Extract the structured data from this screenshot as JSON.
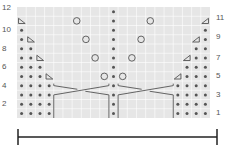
{
  "chart": {
    "type": "knitting-chart",
    "rows": 12,
    "columns": 21,
    "colors": {
      "background": "#e6e6e6",
      "grid": "#ffffff",
      "symbol": "#555555"
    },
    "row_labels_left": [
      "12",
      "10",
      "8",
      "6",
      "4",
      "2"
    ],
    "row_labels_right": [
      "11",
      "9",
      "7",
      "5",
      "3",
      "1"
    ],
    "legend_symbols": {
      "dot": "purl",
      "circle": "yarn-over",
      "triangle-left": "decrease-left",
      "triangle-right": "decrease-right",
      "cable": "cable-cross"
    },
    "dots": {
      "left": [
        [
          1,
          [
            0,
            1,
            2,
            3
          ]
        ],
        [
          2,
          [
            0,
            1,
            2,
            3
          ]
        ],
        [
          3,
          [
            0,
            1,
            2,
            3
          ]
        ],
        [
          4,
          [
            0,
            1,
            2,
            3
          ]
        ],
        [
          5,
          [
            0,
            1,
            2
          ]
        ],
        [
          6,
          [
            0,
            1,
            2
          ]
        ],
        [
          7,
          [
            0,
            1
          ]
        ],
        [
          8,
          [
            0,
            1
          ]
        ],
        [
          9,
          [
            0
          ]
        ],
        [
          10,
          [
            0
          ]
        ]
      ],
      "right": [
        [
          1,
          [
            17,
            18,
            19,
            20
          ]
        ],
        [
          2,
          [
            17,
            18,
            19,
            20
          ]
        ],
        [
          3,
          [
            17,
            18,
            19,
            20
          ]
        ],
        [
          4,
          [
            17,
            18,
            19,
            20
          ]
        ],
        [
          5,
          [
            18,
            19,
            20
          ]
        ],
        [
          6,
          [
            18,
            19,
            20
          ]
        ],
        [
          7,
          [
            19,
            20
          ]
        ],
        [
          8,
          [
            19,
            20
          ]
        ],
        [
          9,
          [
            20
          ]
        ],
        [
          10,
          [
            20
          ]
        ]
      ],
      "center_column": 10
    },
    "triangles_left": [
      [
        5,
        3
      ],
      [
        7,
        2
      ],
      [
        9,
        1
      ],
      [
        11,
        0
      ]
    ],
    "triangles_right": [
      [
        5,
        17
      ],
      [
        7,
        18
      ],
      [
        9,
        19
      ],
      [
        11,
        20
      ]
    ],
    "circles": [
      [
        5,
        9
      ],
      [
        5,
        11
      ],
      [
        7,
        8
      ],
      [
        7,
        12
      ],
      [
        9,
        7
      ],
      [
        9,
        13
      ],
      [
        11,
        6
      ],
      [
        11,
        14
      ]
    ],
    "cables": [
      {
        "rows": [
          1,
          4
        ],
        "cols": [
          4,
          9
        ]
      },
      {
        "rows": [
          1,
          4
        ],
        "cols": [
          11,
          16
        ]
      }
    ]
  },
  "scale_bar": {
    "label": ""
  }
}
